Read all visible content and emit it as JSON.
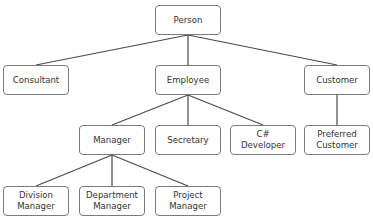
{
  "diagram": {
    "type": "class-hierarchy-tree",
    "nodes": [
      {
        "id": "person",
        "label": "Person",
        "x": 155,
        "y": 5
      },
      {
        "id": "consultant",
        "label": "Consultant",
        "x": 3,
        "y": 65
      },
      {
        "id": "employee",
        "label": "Employee",
        "x": 155,
        "y": 65
      },
      {
        "id": "customer",
        "label": "Customer",
        "x": 304,
        "y": 65
      },
      {
        "id": "manager",
        "label": "Manager",
        "x": 79,
        "y": 125
      },
      {
        "id": "secretary",
        "label": "Secretary",
        "x": 155,
        "y": 125
      },
      {
        "id": "csharp-developer",
        "label": "C#\nDeveloper",
        "x": 230,
        "y": 125
      },
      {
        "id": "preferred-customer",
        "label": "Preferred\nCustomer",
        "x": 304,
        "y": 125
      },
      {
        "id": "division-manager",
        "label": "Division\nManager",
        "x": 3,
        "y": 186
      },
      {
        "id": "department-manager",
        "label": "Department\nManager",
        "x": 79,
        "y": 186
      },
      {
        "id": "project-manager",
        "label": "Project\nManager",
        "x": 155,
        "y": 186
      }
    ],
    "edges": [
      {
        "from": "person",
        "to": "consultant"
      },
      {
        "from": "person",
        "to": "employee"
      },
      {
        "from": "person",
        "to": "customer"
      },
      {
        "from": "employee",
        "to": "manager"
      },
      {
        "from": "employee",
        "to": "secretary"
      },
      {
        "from": "employee",
        "to": "csharp-developer"
      },
      {
        "from": "customer",
        "to": "preferred-customer"
      },
      {
        "from": "manager",
        "to": "division-manager"
      },
      {
        "from": "manager",
        "to": "department-manager"
      },
      {
        "from": "manager",
        "to": "project-manager"
      }
    ],
    "colors": {
      "line": "#4a4a4a",
      "border": "#7a7a7a",
      "text": "#333333"
    }
  }
}
